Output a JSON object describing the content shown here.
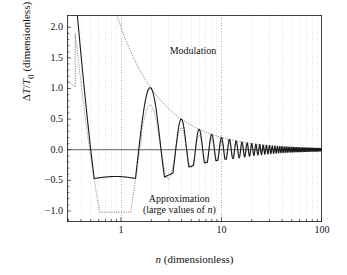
{
  "chart_data": {
    "type": "line",
    "title": "",
    "xlabel": "n (dimensionless)",
    "ylabel": "ΔT/T₀ (dimensionless)",
    "xscale": "log",
    "yscale": "linear",
    "xlim": [
      0.29,
      100
    ],
    "ylim": [
      -1.18,
      2.2
    ],
    "grid": true,
    "grid_style": "vertical log minor gridlines, dotted decade lines at n = 1, 10",
    "legend_position": "inline annotations",
    "xticks_major": [
      1,
      10,
      100
    ],
    "xtick_labels": [
      "1",
      "10",
      "100"
    ],
    "yticks": [
      2.0,
      1.5,
      1.0,
      0.5,
      0.0,
      -0.5,
      -1.0
    ],
    "ytick_labels": [
      "2.0",
      "1.5",
      "1.0",
      "0.5",
      "0.0",
      "-0.5",
      "-1.0"
    ],
    "zero_line": 0.0,
    "annotations": [
      {
        "name": "modulation",
        "text": "Modulation",
        "x": 3.05,
        "y": 1.62
      },
      {
        "name": "approximation",
        "line1": "Approximation",
        "line2": "(large values of n)",
        "x": 1.65,
        "y": -0.8
      }
    ],
    "series": [
      {
        "name": "exact",
        "label": "",
        "style": "solid",
        "color": "#1a1a1a",
        "width": 1.1,
        "formula": "(2/n)*sin(pi*n)/(pi*n) style oscillation; |y| envelope = 2/n, period 1 in n, first branch falls from 2.2 at n=0.30 crossing 0 near n=0.55, minimum -0.47 near n=0.95, peak 2.03 at n=2",
        "key_points": [
          {
            "x": 0.3,
            "y": 2.2
          },
          {
            "x": 0.4,
            "y": 0.95
          },
          {
            "x": 0.55,
            "y": 0.0
          },
          {
            "x": 0.95,
            "y": -0.47
          },
          {
            "x": 1.5,
            "y": 0.0
          },
          {
            "x": 2.0,
            "y": 2.03
          },
          {
            "x": 2.5,
            "y": 0.0
          },
          {
            "x": 3.0,
            "y": -0.36
          },
          {
            "x": 4.0,
            "y": 0.95
          },
          {
            "x": 5.0,
            "y": -0.32
          },
          {
            "x": 6.0,
            "y": 0.6
          },
          {
            "x": 7.0,
            "y": -0.3
          },
          {
            "x": 8.0,
            "y": 0.44
          },
          {
            "x": 10.0,
            "y": 0.34
          },
          {
            "x": 20.0,
            "y": 0.2
          },
          {
            "x": 50.0,
            "y": 0.12
          },
          {
            "x": 100.0,
            "y": 0.08
          }
        ]
      },
      {
        "name": "modulation_envelope",
        "label": "Modulation",
        "style": "dotted",
        "color": "#555555",
        "width": 0.9,
        "formula": "y = 2/n",
        "key_points": [
          {
            "x": 0.9,
            "y": 2.2
          },
          {
            "x": 1.0,
            "y": 2.0
          },
          {
            "x": 2.0,
            "y": 1.0
          },
          {
            "x": 3.0,
            "y": 0.67
          },
          {
            "x": 5.0,
            "y": 0.4
          },
          {
            "x": 10.0,
            "y": 0.2
          },
          {
            "x": 20.0,
            "y": 0.1
          },
          {
            "x": 50.0,
            "y": 0.04
          },
          {
            "x": 100.0,
            "y": 0.02
          }
        ]
      },
      {
        "name": "approximation",
        "label": "Approximation (large values of n)",
        "style": "dotted",
        "color": "#666666",
        "width": 0.9,
        "formula": "large-n asymptotic oscillation; amplitude approaches 2/n from below for small n, merges with exact curve for n > 8",
        "key_points": [
          {
            "x": 0.3,
            "y": 1.02
          },
          {
            "x": 0.5,
            "y": 0.5
          },
          {
            "x": 0.7,
            "y": -0.2
          },
          {
            "x": 0.95,
            "y": -1.0
          },
          {
            "x": 1.3,
            "y": -0.55
          },
          {
            "x": 1.55,
            "y": 0.0
          },
          {
            "x": 2.0,
            "y": 0.68
          },
          {
            "x": 2.45,
            "y": 0.0
          },
          {
            "x": 3.0,
            "y": -0.57
          },
          {
            "x": 4.0,
            "y": 0.5
          },
          {
            "x": 5.0,
            "y": -0.44
          },
          {
            "x": 6.0,
            "y": 0.38
          },
          {
            "x": 7.0,
            "y": -0.35
          },
          {
            "x": 10.0,
            "y": 0.25
          },
          {
            "x": 20.0,
            "y": 0.13
          },
          {
            "x": 100.0,
            "y": 0.03
          }
        ]
      }
    ]
  },
  "axes": {
    "xlabel_prefix": "",
    "xlabel_italic": "n",
    "xlabel_rest": " (dimensionless)",
    "ylabel_text": "ΔT/T₀ (dimensionless)"
  },
  "labels": {
    "modulation": "Modulation",
    "approximation_line1": "Approximation",
    "approximation_line2_pre": "(large values of ",
    "approximation_line2_it": "n",
    "approximation_line2_post": ")"
  },
  "colors": {
    "frame": "#222222",
    "curve": "#1a1a1a",
    "dotted": "#5a5a5a",
    "grid": "#cfcfcf",
    "grid_decade": "#9a9a9a",
    "background": "#ffffff"
  }
}
